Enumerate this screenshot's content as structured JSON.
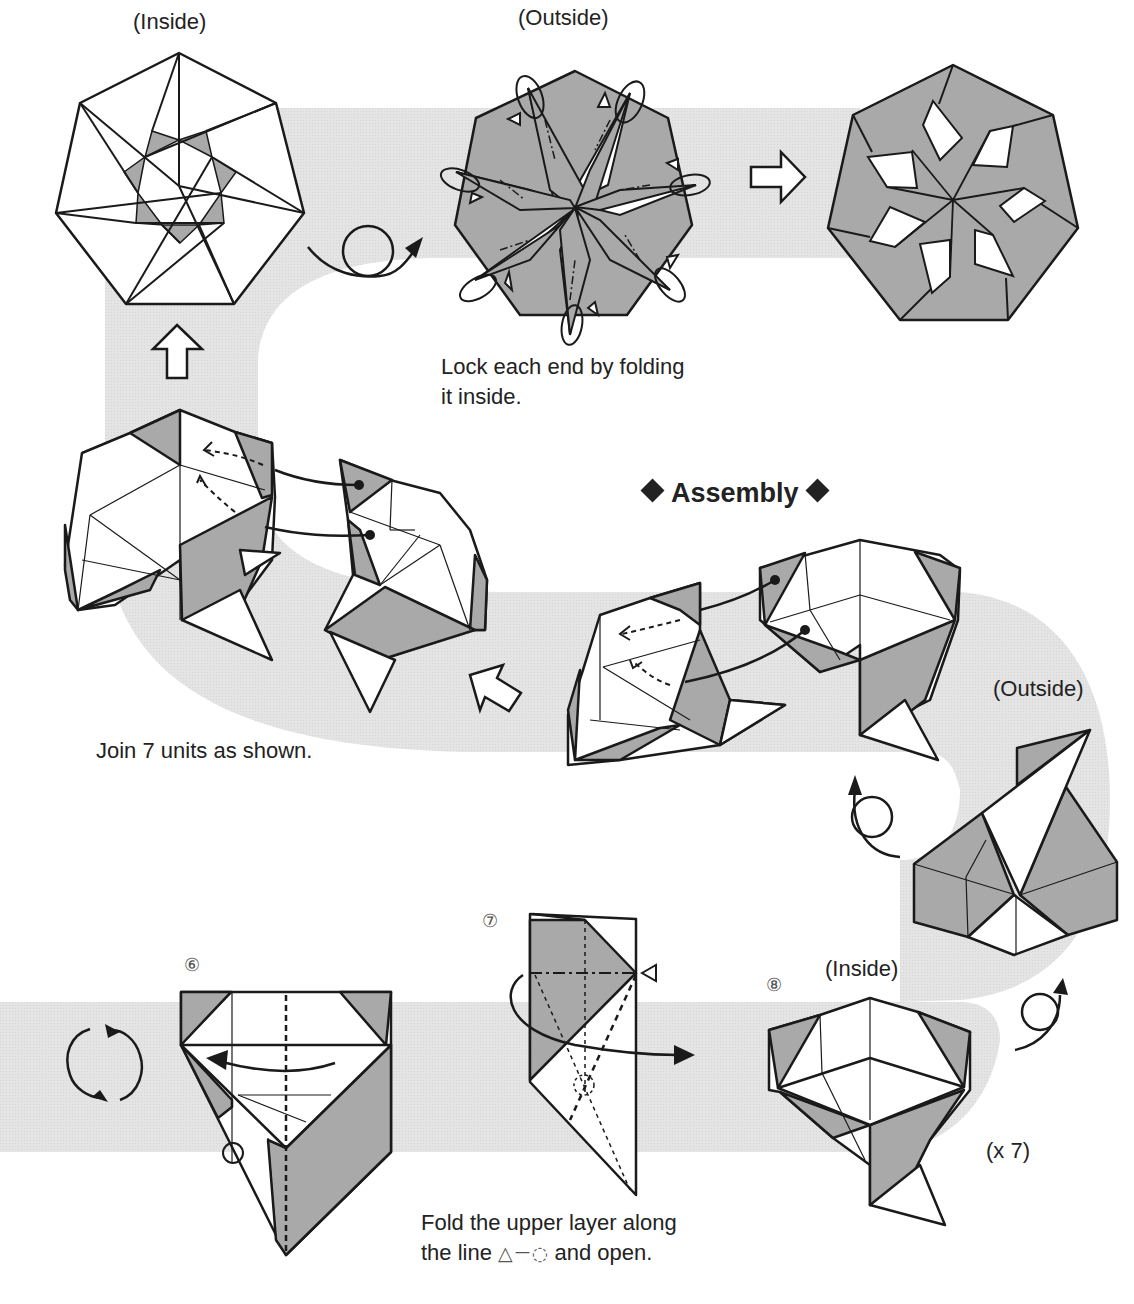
{
  "colors": {
    "paper_white": "#ffffff",
    "paper_gray": "#a9a9a9",
    "band_gray": "#e6e6e6",
    "line": "#1a1a1a"
  },
  "top_row": {
    "inside_label": "(Inside)",
    "outside_label": "(Outside)",
    "lock_caption_line1": "Lock each end by folding",
    "lock_caption_line2": "it inside."
  },
  "assembly": {
    "heading": "Assembly",
    "join_caption": "Join 7 units as shown.",
    "outside_label": "(Outside)"
  },
  "steps": [
    {
      "number": "⑥"
    },
    {
      "number": "⑦",
      "caption_line1": "Fold the upper layer along",
      "caption_line2_a": "the line",
      "caption_symbols": "△－◌",
      "caption_line2_b": "and open."
    },
    {
      "number": "⑧",
      "label": "(Inside)",
      "repeat": "(x 7)"
    }
  ],
  "icons": [
    "flip-over-icon",
    "rotate-icon",
    "outline-arrow-up-icon",
    "outline-arrow-right-icon",
    "outline-arrow-up-left-icon",
    "fold-behind-arrow-icon",
    "valley-fold-arrow-icon"
  ]
}
